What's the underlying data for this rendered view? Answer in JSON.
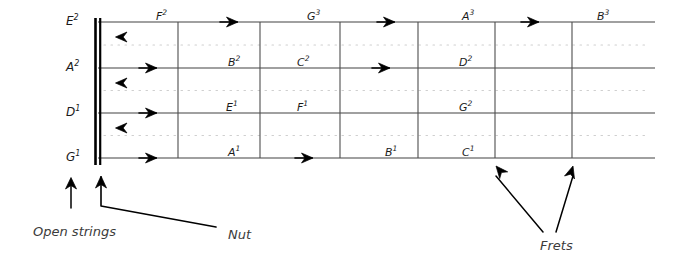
{
  "diagram": {
    "colors": {
      "string_line": "#808080",
      "fret_line": "#4d4d4d",
      "nut": "#000000",
      "dotted_guide": "#cfcfcf",
      "arrow": "#000000",
      "text": "#1a1a1a",
      "annotation_text": "#3b3b3b"
    },
    "strings": [
      {
        "name": "string-E2",
        "open_label": "E",
        "open_octave": "2",
        "y": 22,
        "notes": [
          {
            "label": "F",
            "octave": "2",
            "x": 156
          },
          {
            "label": "G",
            "octave": "3",
            "x": 307
          },
          {
            "label": "A",
            "octave": "3",
            "x": 462
          },
          {
            "label": "B",
            "octave": "3",
            "x": 597
          }
        ],
        "right_arrows": [
          233,
          390,
          534
        ],
        "left_arrow": 120
      },
      {
        "name": "string-A2",
        "open_label": "A",
        "open_octave": "2",
        "y": 68,
        "notes": [
          {
            "label": "B",
            "octave": "2",
            "x": 228
          },
          {
            "label": "C",
            "octave": "2",
            "x": 297
          },
          {
            "label": "D",
            "octave": "2",
            "x": 459
          }
        ],
        "right_arrows": [
          152,
          385
        ],
        "left_arrow": 120
      },
      {
        "name": "string-D1",
        "open_label": "D",
        "open_octave": "1",
        "y": 113,
        "notes": [
          {
            "label": "E",
            "octave": "1",
            "x": 226
          },
          {
            "label": "F",
            "octave": "1",
            "x": 297
          },
          {
            "label": "G",
            "octave": "2",
            "x": 459
          }
        ],
        "right_arrows": [
          152
        ],
        "left_arrow": 120
      },
      {
        "name": "string-G1",
        "open_label": "G",
        "open_octave": "1",
        "y": 158,
        "notes": [
          {
            "label": "A",
            "octave": "1",
            "x": 228
          },
          {
            "label": "B",
            "octave": "1",
            "x": 385
          },
          {
            "label": "C",
            "octave": "1",
            "x": 462
          }
        ],
        "right_arrows": [
          152,
          308
        ],
        "left_arrow": null
      }
    ],
    "frets": [
      178,
      260,
      340,
      418,
      495,
      572
    ],
    "nut": {
      "x": 98,
      "y_top": 18,
      "y_bottom": 165
    },
    "board": {
      "x_start": 98,
      "x_end": 655,
      "y_top": 22,
      "y_bottom": 158
    },
    "annotations": [
      {
        "name": "open-strings",
        "text": "Open strings",
        "x": 33,
        "y": 224
      },
      {
        "name": "nut",
        "text": "Nut",
        "x": 228,
        "y": 227
      },
      {
        "name": "frets",
        "text": "Frets",
        "x": 540,
        "y": 238
      }
    ]
  }
}
